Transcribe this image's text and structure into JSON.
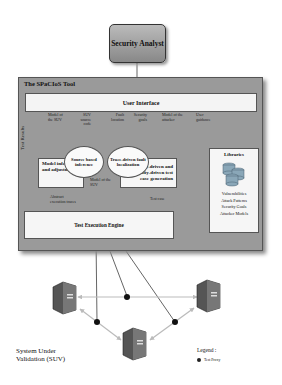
{
  "diagram": {
    "actor": {
      "label": "Security Analyst"
    },
    "tool": {
      "title": "The SPaCIoS Tool",
      "user_interface": "User Interface",
      "test_results_label": "Test Results",
      "labels": {
        "model_of_suv_1": "Model of the SUV",
        "suv_source_code": "SUV source code",
        "fault_location": "Fault location",
        "security_goals": "Security goals",
        "model_of_attacker": "Model of the attacker",
        "user_guidance": "User guidance",
        "model_of_suv_2": "Model of the SUV",
        "abstract_execution_traces": "Abstract execution traces",
        "test_case": "Test case"
      },
      "components": {
        "model_inference": "Model inference and adjustment",
        "source_inference": "Source based inference",
        "trace_fault": "Trace-driven fault localization",
        "property_driven": "Property-driven and vulnerability-driven test case generation",
        "test_engine": "Test Execution Engine"
      },
      "libraries": {
        "title": "Libraries",
        "items": [
          "Vulnerabilities",
          "Attack Patterns",
          "Security Goals",
          "Attacker Models"
        ]
      }
    },
    "suv": {
      "label_line1": "System Under",
      "label_line2": "Validation  (SUV)",
      "server_count": 3,
      "proxy_count": 3
    },
    "legend": {
      "title": "Legend :",
      "items": [
        {
          "symbol": "black-dot",
          "label": "Test Proxy"
        }
      ]
    }
  }
}
